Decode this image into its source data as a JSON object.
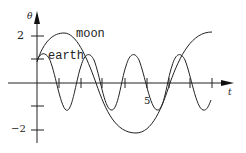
{
  "diagram": {
    "y_axis_label": "θ",
    "x_axis_label": "t",
    "y_ticks": [
      {
        "label": "2"
      },
      {
        "label": "−2"
      }
    ],
    "x_ticks": [
      {
        "label": "5"
      }
    ],
    "curves": [
      {
        "name": "moon",
        "label": "moon"
      },
      {
        "name": "earth",
        "label": "earth"
      }
    ],
    "colors": {
      "ink": "#222222",
      "background": "#ffffff"
    }
  }
}
